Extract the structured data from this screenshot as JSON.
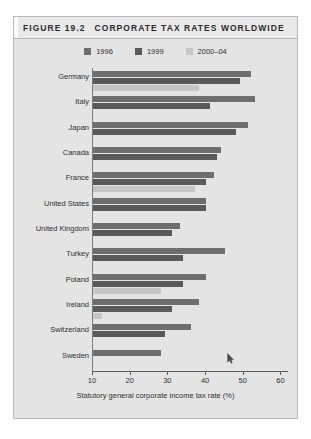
{
  "figure": {
    "number": "FIGURE 19.2",
    "title": "CORPORATE TAX RATES WORLDWIDE"
  },
  "colors": {
    "series_1996": "#6e6e6e",
    "series_1999": "#595959",
    "series_2000_04": "#c6c6c6",
    "panel_background": "#e4e4e4",
    "title_background": "#e9e9e9",
    "axis": "#5c5c5c"
  },
  "legend": {
    "position": "top-center",
    "items": [
      {
        "label": "1996",
        "color": "#6e6e6e"
      },
      {
        "label": "1999",
        "color": "#595959"
      },
      {
        "label": "2000–04",
        "color": "#c6c6c6"
      }
    ]
  },
  "chart_data": {
    "type": "bar",
    "orientation": "horizontal",
    "title": "CORPORATE TAX RATES WORLDWIDE",
    "xlabel": "Statutory general corporate income tax rate (%)",
    "ylabel": "",
    "xlim": [
      10,
      62
    ],
    "xticks": [
      10,
      20,
      30,
      40,
      50,
      60
    ],
    "grid": false,
    "categories": [
      "Germany",
      "Italy",
      "Japan",
      "Canada",
      "France",
      "United States",
      "United Kingdom",
      "Turkey",
      "Poland",
      "Ireland",
      "Switzerland",
      "Sweden"
    ],
    "series": [
      {
        "name": "1996",
        "color": "#6e6e6e",
        "values": [
          52,
          53,
          51,
          44,
          42,
          40,
          33,
          45,
          40,
          38,
          36,
          28
        ]
      },
      {
        "name": "1999",
        "color": "#595959",
        "values": [
          49,
          41,
          48,
          43,
          40,
          40,
          31,
          34,
          34,
          31,
          29,
          null
        ]
      },
      {
        "name": "2000–04",
        "color": "#c6c6c6",
        "values": [
          38,
          null,
          null,
          null,
          37,
          null,
          null,
          null,
          28,
          12.5,
          null,
          null
        ]
      }
    ]
  },
  "axis": {
    "tick_labels": [
      "10",
      "20",
      "30",
      "40",
      "50",
      "60"
    ],
    "x_title": "Statutory general corporate income tax rate (%)"
  },
  "cursor": {
    "glyph": "↖"
  }
}
